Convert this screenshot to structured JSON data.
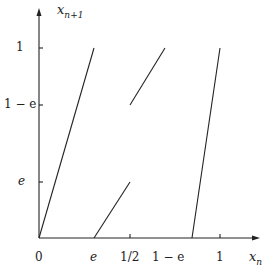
{
  "diagram": {
    "title": "",
    "y_axis_label": {
      "var": "x",
      "sub": "n+1"
    },
    "x_axis_label": {
      "var": "x",
      "sub": "n"
    },
    "y_ticks": [
      {
        "label": "1"
      },
      {
        "label": "1 − e"
      },
      {
        "label": "e"
      }
    ],
    "x_ticks": [
      {
        "label": "0"
      },
      {
        "label": "e"
      },
      {
        "label": "1/2"
      },
      {
        "label": "1 − e"
      },
      {
        "label": "1"
      }
    ],
    "segments": [
      {
        "from": [
          0,
          0
        ],
        "to": [
          "e",
          1
        ]
      },
      {
        "from": [
          "e",
          0
        ],
        "to": [
          "1/2",
          "e"
        ]
      },
      {
        "from": [
          "1/2",
          "1-e"
        ],
        "to": [
          "1-e",
          1
        ]
      },
      {
        "from": [
          "1-e",
          0
        ],
        "to": [
          1,
          1
        ]
      }
    ],
    "line_color": "#222222"
  }
}
